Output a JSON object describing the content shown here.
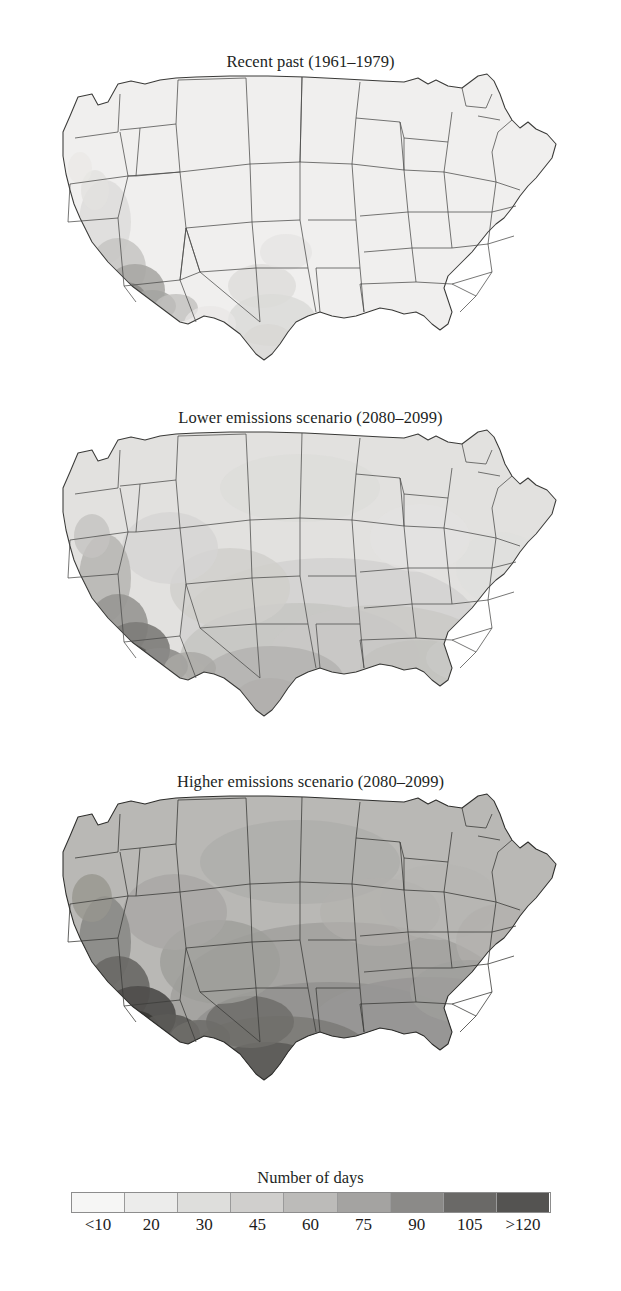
{
  "figure": {
    "kind": "choropleth-map-series",
    "region": "Contiguous United States",
    "background_color": "#ffffff"
  },
  "panels": [
    {
      "id": "recent-past",
      "title": "Recent past (1961–1979)",
      "period": "1961–1979"
    },
    {
      "id": "lower-emissions",
      "title": "Lower emissions scenario (2080–2099)",
      "period": "2080–2099"
    },
    {
      "id": "higher-emissions",
      "title": "Higher emissions scenario (2080–2099)",
      "period": "2080–2099"
    }
  ],
  "legend": {
    "title": "Number of days",
    "labels": [
      "<10",
      "20",
      "30",
      "45",
      "60",
      "75",
      "90",
      "105",
      ">120"
    ],
    "colors": [
      "#f6f6f5",
      "#ececeb",
      "#dededc",
      "#d0cfcd",
      "#bcbbb9",
      "#a4a3a1",
      "#8b8a88",
      "#6a6967",
      "#545351"
    ],
    "outline_color": "#8d8d8d"
  },
  "chart_data": {
    "type": "heatmap",
    "subtitle": "Three panels: recent past and two future emissions scenarios",
    "xlabel": "",
    "ylabel": "",
    "grid": false,
    "legend_position": "bottom",
    "colorbar": {
      "label": "Number of days",
      "tick_labels": [
        "<10",
        "20",
        "30",
        "45",
        "60",
        "75",
        "90",
        "105",
        ">120"
      ],
      "bin_edges": [
        0,
        10,
        20,
        30,
        45,
        60,
        75,
        90,
        105,
        120
      ],
      "colors": [
        "#f6f6f5",
        "#ececeb",
        "#dededc",
        "#d0cfcd",
        "#bcbbb9",
        "#a4a3a1",
        "#8b8a88",
        "#6a6967",
        "#545351"
      ]
    },
    "panels": [
      {
        "name": "Recent past (1961–1979)",
        "regions": [
          {
            "region": "Pacific Northwest",
            "value": 5
          },
          {
            "region": "Northern Rockies",
            "value": 5
          },
          {
            "region": "Upper Midwest",
            "value": 5
          },
          {
            "region": "Northeast",
            "value": 5
          },
          {
            "region": "Great Lakes",
            "value": 5
          },
          {
            "region": "Central California",
            "value": 25
          },
          {
            "region": "Southern California desert",
            "value": 100
          },
          {
            "region": "Arizona low desert",
            "value": 120
          },
          {
            "region": "Southern Nevada",
            "value": 60
          },
          {
            "region": "Southern New Mexico",
            "value": 45
          },
          {
            "region": "West Texas",
            "value": 30
          },
          {
            "region": "Central Texas",
            "value": 25
          },
          {
            "region": "Southern Plains",
            "value": 20
          },
          {
            "region": "Southeast",
            "value": 8
          },
          {
            "region": "Gulf Coast",
            "value": 10
          },
          {
            "region": "Florida",
            "value": 8
          },
          {
            "region": "Mid-Atlantic",
            "value": 6
          }
        ]
      },
      {
        "name": "Lower emissions scenario (2080–2099)",
        "regions": [
          {
            "region": "Pacific Northwest",
            "value": 20
          },
          {
            "region": "Northern Rockies",
            "value": 25
          },
          {
            "region": "Upper Midwest",
            "value": 20
          },
          {
            "region": "Northeast",
            "value": 15
          },
          {
            "region": "Great Lakes",
            "value": 20
          },
          {
            "region": "Central California",
            "value": 55
          },
          {
            "region": "Southern California desert",
            "value": 120
          },
          {
            "region": "Arizona low desert",
            "value": 120
          },
          {
            "region": "Southern Nevada",
            "value": 95
          },
          {
            "region": "Southern New Mexico",
            "value": 75
          },
          {
            "region": "West Texas",
            "value": 70
          },
          {
            "region": "Central Texas",
            "value": 75
          },
          {
            "region": "Southern Plains",
            "value": 60
          },
          {
            "region": "Southeast",
            "value": 45
          },
          {
            "region": "Gulf Coast",
            "value": 50
          },
          {
            "region": "Florida",
            "value": 30
          },
          {
            "region": "Mid-Atlantic",
            "value": 30
          }
        ]
      },
      {
        "name": "Higher emissions scenario (2080–2099)",
        "regions": [
          {
            "region": "Pacific Northwest",
            "value": 45
          },
          {
            "region": "Northern Rockies",
            "value": 55
          },
          {
            "region": "Upper Midwest",
            "value": 55
          },
          {
            "region": "Northeast",
            "value": 45
          },
          {
            "region": "Great Lakes",
            "value": 50
          },
          {
            "region": "Central California",
            "value": 80
          },
          {
            "region": "Southern California desert",
            "value": 120
          },
          {
            "region": "Arizona low desert",
            "value": 120
          },
          {
            "region": "Southern Nevada",
            "value": 120
          },
          {
            "region": "Southern New Mexico",
            "value": 105
          },
          {
            "region": "West Texas",
            "value": 105
          },
          {
            "region": "Central Texas",
            "value": 120
          },
          {
            "region": "Southern Plains",
            "value": 105
          },
          {
            "region": "Southeast",
            "value": 90
          },
          {
            "region": "Gulf Coast",
            "value": 95
          },
          {
            "region": "Florida",
            "value": 75
          },
          {
            "region": "Mid-Atlantic",
            "value": 75
          }
        ]
      }
    ]
  }
}
